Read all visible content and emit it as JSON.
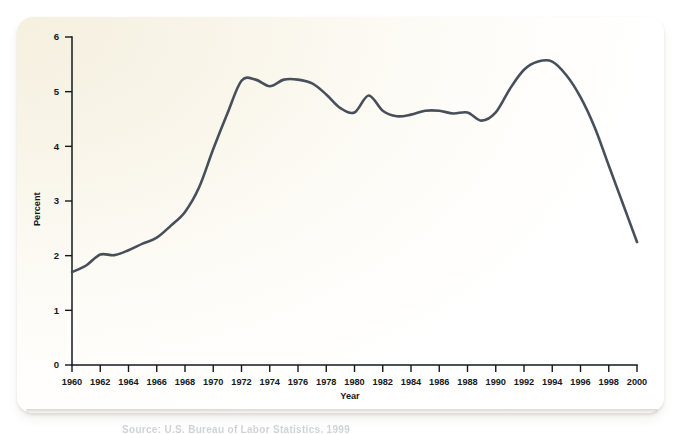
{
  "figure": {
    "card_name": "figure-card",
    "caption_ghost": "Source: U.S. Bureau of Labor Statistics, 1999",
    "accent_color": "#464f5a",
    "axis_color": "#15181c",
    "card_tint": "#f5f0df"
  },
  "chart_data": {
    "type": "line",
    "title": "",
    "subtitle": "",
    "xlabel": "Year",
    "ylabel": "Percent",
    "xlim": [
      1960,
      2000
    ],
    "ylim": [
      0,
      6
    ],
    "grid": false,
    "legend": null,
    "x_ticks": [
      1960,
      1962,
      1964,
      1966,
      1968,
      1970,
      1972,
      1974,
      1976,
      1978,
      1980,
      1982,
      1984,
      1986,
      1988,
      1990,
      1992,
      1994,
      1996,
      1998,
      2000
    ],
    "x_tick_labels": [
      "1960",
      "1962",
      "1964",
      "1966",
      "1968",
      "1970",
      "1972",
      "1974",
      "1976",
      "1978",
      "1980",
      "1982",
      "1984",
      "1986",
      "1988",
      "1990",
      "1992",
      "1994",
      "1996",
      "1998",
      "2000"
    ],
    "y_ticks": [
      0,
      1,
      2,
      3,
      4,
      5,
      6
    ],
    "y_tick_labels": [
      "0",
      "1",
      "2",
      "3",
      "4",
      "5",
      "6"
    ],
    "x": [
      1960,
      1961,
      1962,
      1963,
      1964,
      1965,
      1966,
      1967,
      1968,
      1969,
      1970,
      1971,
      1972,
      1973,
      1974,
      1975,
      1976,
      1977,
      1978,
      1979,
      1980,
      1981,
      1982,
      1983,
      1984,
      1985,
      1986,
      1987,
      1988,
      1989,
      1990,
      1991,
      1992,
      1993,
      1994,
      1995,
      1996,
      1997,
      1998,
      1999,
      2000
    ],
    "series": [
      {
        "name": "Percent",
        "color": "#464f5a",
        "values": [
          1.7,
          1.82,
          2.02,
          2.01,
          2.1,
          2.22,
          2.33,
          2.55,
          2.8,
          3.25,
          3.95,
          4.6,
          5.2,
          5.22,
          5.1,
          5.22,
          5.22,
          5.15,
          4.95,
          4.7,
          4.62,
          4.93,
          4.65,
          4.55,
          4.58,
          4.65,
          4.65,
          4.6,
          4.62,
          4.47,
          4.62,
          5.05,
          5.4,
          5.55,
          5.55,
          5.3,
          4.9,
          4.35,
          3.65,
          2.95,
          2.25
        ]
      }
    ]
  }
}
